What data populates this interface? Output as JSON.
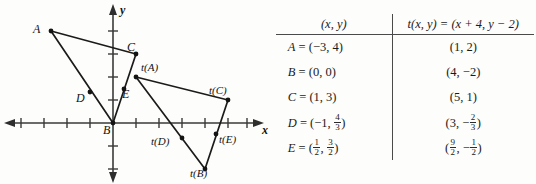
{
  "figure": {
    "axis_labels": {
      "x": "x",
      "y": "y"
    },
    "origin_label": "B",
    "points": [
      {
        "name": "A",
        "label": "A",
        "x": -3,
        "y": 4
      },
      {
        "name": "B",
        "label": "B",
        "x": 0,
        "y": 0
      },
      {
        "name": "C",
        "label": "C",
        "x": 1,
        "y": 3
      },
      {
        "name": "D",
        "label": "D",
        "x": -1,
        "y": 1.333
      },
      {
        "name": "E",
        "label": "E",
        "x": 0.5,
        "y": 1.5
      },
      {
        "name": "t(A)",
        "label": "t(A)",
        "x": 1,
        "y": 2
      },
      {
        "name": "t(B)",
        "label": "t(B)",
        "x": 4,
        "y": -2
      },
      {
        "name": "t(C)",
        "label": "t(C)",
        "x": 5,
        "y": 1
      },
      {
        "name": "t(D)",
        "label": "t(D)",
        "x": 3,
        "y": -0.667
      },
      {
        "name": "t(E)",
        "label": "t(E)",
        "x": 4.5,
        "y": -0.5
      }
    ],
    "triangles": [
      {
        "name": "original-triangle",
        "vertices": [
          "A",
          "B",
          "C"
        ]
      },
      {
        "name": "transformed-triangle",
        "vertices": [
          "t(A)",
          "t(B)",
          "t(C)"
        ]
      }
    ]
  },
  "table": {
    "header": {
      "left": "(x, y)",
      "right_prefix": "t(x, y) = (x + 4, y",
      "right_suffix": "2)"
    },
    "rows": [
      {
        "point": "A",
        "source": "(−3, 4)",
        "image": "(1, 2)"
      },
      {
        "point": "B",
        "source": "(0, 0)",
        "image": "(4, −2)"
      },
      {
        "point": "C",
        "source": "(1, 3)",
        "image": "(5, 1)"
      },
      {
        "point": "D",
        "source_prefix": "(−1,",
        "source_frac": "4/3",
        "image_prefix": "(3, −",
        "image_frac": "2/3"
      },
      {
        "point": "E",
        "source_prefix": "(",
        "source_frac_a": "1/2",
        "source_frac_b": "3/2",
        "image_frac_a": "9/2",
        "image_frac_b": "1/2"
      }
    ]
  },
  "colors": {
    "ink": "#1a1a1a",
    "axis": "#3a3a3a",
    "background": "#fdfdfb"
  }
}
